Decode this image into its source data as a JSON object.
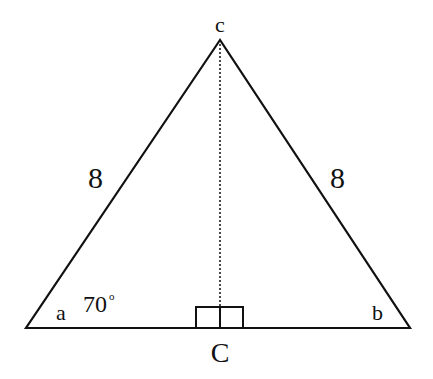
{
  "diagram": {
    "vertices": {
      "apex": {
        "label": "c"
      },
      "left": {
        "label": "a"
      },
      "right": {
        "label": "b"
      },
      "foot": {
        "label": "C"
      }
    },
    "sides": {
      "left": {
        "label": "8"
      },
      "right": {
        "label": "8"
      }
    },
    "angle": {
      "value": "70",
      "unit": "°"
    },
    "colors": {
      "stroke": "#111111",
      "background": "#ffffff"
    }
  }
}
